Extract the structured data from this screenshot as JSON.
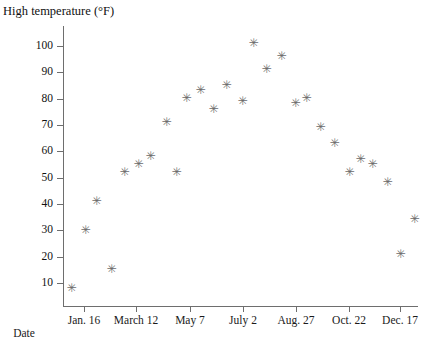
{
  "chart_data": {
    "type": "scatter",
    "title": "",
    "ylabel": "High temperature (°F)",
    "xlabel": "Date",
    "grid": false,
    "legend": "none",
    "marker": "asterisk",
    "marker_color": "#6b6b6b",
    "ylim": [
      0,
      106
    ],
    "yticks": [
      10,
      20,
      30,
      40,
      50,
      60,
      70,
      80,
      90,
      100
    ],
    "ytick_labels": [
      "10",
      "20",
      "30",
      "40",
      "50",
      "60",
      "70",
      "80",
      "90",
      "100"
    ],
    "xtick_labels": [
      "Jan. 16",
      "March 12",
      "May 7",
      "July 2",
      "Aug. 27",
      "Oct. 22",
      "Dec. 17"
    ],
    "xtick_positions_px": [
      84,
      136,
      190,
      243,
      296,
      349,
      400
    ],
    "points": [
      {
        "x_px": 71,
        "y_f": 8
      },
      {
        "x_px": 85,
        "y_f": 30
      },
      {
        "x_px": 96,
        "y_f": 41
      },
      {
        "x_px": 111,
        "y_f": 15
      },
      {
        "x_px": 124,
        "y_f": 52
      },
      {
        "x_px": 138,
        "y_f": 55
      },
      {
        "x_px": 150,
        "y_f": 58
      },
      {
        "x_px": 166,
        "y_f": 71
      },
      {
        "x_px": 176,
        "y_f": 52
      },
      {
        "x_px": 186,
        "y_f": 80
      },
      {
        "x_px": 200,
        "y_f": 83
      },
      {
        "x_px": 213,
        "y_f": 76
      },
      {
        "x_px": 226,
        "y_f": 85
      },
      {
        "x_px": 242,
        "y_f": 79
      },
      {
        "x_px": 253,
        "y_f": 101
      },
      {
        "x_px": 266,
        "y_f": 91
      },
      {
        "x_px": 281,
        "y_f": 96
      },
      {
        "x_px": 295,
        "y_f": 78
      },
      {
        "x_px": 306,
        "y_f": 80
      },
      {
        "x_px": 320,
        "y_f": 69
      },
      {
        "x_px": 334,
        "y_f": 63
      },
      {
        "x_px": 349,
        "y_f": 52
      },
      {
        "x_px": 360,
        "y_f": 57
      },
      {
        "x_px": 372,
        "y_f": 55
      },
      {
        "x_px": 387,
        "y_f": 48
      },
      {
        "x_px": 400,
        "y_f": 21
      },
      {
        "x_px": 414,
        "y_f": 34
      }
    ],
    "marker_glyph": "✳"
  },
  "axes": {
    "y_title": "High temperature (°F)",
    "x_title": "Date"
  }
}
